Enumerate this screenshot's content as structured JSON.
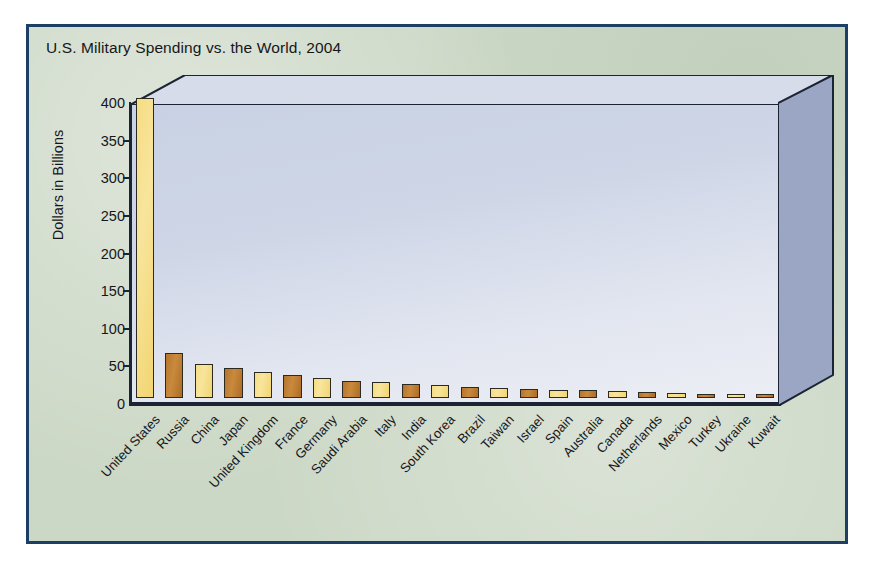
{
  "chart_data": {
    "type": "bar",
    "title": "U.S. Military Spending vs. the World, 2004",
    "xlabel": "",
    "ylabel": "Dollars in Billions",
    "ylim": [
      0,
      400
    ],
    "ytick_step": 50,
    "yticks": [
      "400",
      "350",
      "300",
      "250",
      "200",
      "150",
      "100",
      "50",
      "0"
    ],
    "grid": false,
    "legend": "none",
    "categories": [
      "United States",
      "Russia",
      "China",
      "Japan",
      "United Kingdom",
      "France",
      "Germany",
      "Saudi Arabia",
      "Italy",
      "India",
      "South Korea",
      "Brazil",
      "Taiwan",
      "Israel",
      "Spain",
      "Australia",
      "Canada",
      "Netherlands",
      "Mexico",
      "Turkey",
      "Ukraine",
      "Kuwait"
    ],
    "values": [
      399,
      60,
      45,
      40,
      34,
      30,
      26,
      22,
      21,
      18,
      17,
      14,
      13,
      12,
      11,
      10,
      9,
      8,
      7,
      6,
      5,
      4
    ],
    "bar_colors": [
      "#f6dd84",
      "#c08236",
      "#f6dd84",
      "#c08236",
      "#f6dd84",
      "#c08236",
      "#f6dd84",
      "#c08236",
      "#f6dd84",
      "#c08236",
      "#f6dd84",
      "#c08236",
      "#f6dd84",
      "#c08236",
      "#f6dd84",
      "#c08236",
      "#f6dd84",
      "#c08236",
      "#f6dd84",
      "#c08236",
      "#f6dd84",
      "#c08236"
    ]
  },
  "style": {
    "panel_background": "#ccd8c6",
    "frame_border": "#1d3f66",
    "plot_wall": "#cdd5e6",
    "axis_color": "#1b2433",
    "accent_yellow": "#f6dd84",
    "accent_brown": "#c08236"
  }
}
